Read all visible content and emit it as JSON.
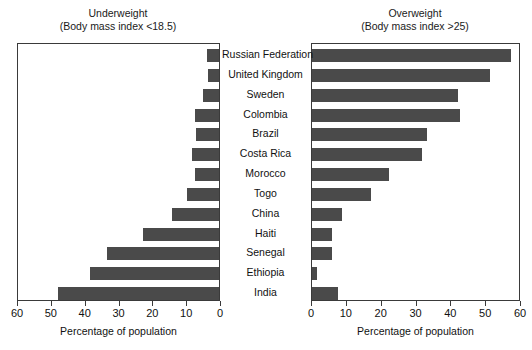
{
  "chart_data": {
    "type": "bar",
    "orientation": "horizontal",
    "layout": "paired-pyramid",
    "categories": [
      "Russian Federation",
      "United Kingdom",
      "Sweden",
      "Colombia",
      "Brazil",
      "Costa Rica",
      "Morocco",
      "Togo",
      "China",
      "Haiti",
      "Senegal",
      "Ethiopia",
      "India"
    ],
    "panels": [
      {
        "id": "underweight",
        "title_line1": "Underweight",
        "title_line2": "(Body mass index <18.5)",
        "xlabel": "Percentage of population",
        "xlim": [
          60,
          0
        ],
        "direction": "right-to-left",
        "ticks": [
          60,
          50,
          40,
          30,
          20,
          10,
          0
        ],
        "tick_labels": [
          "60",
          "50",
          "40",
          "30",
          "20",
          "10",
          "0"
        ],
        "values": [
          3.5,
          3.3,
          4.7,
          7.0,
          6.8,
          8.0,
          7.0,
          9.5,
          14.0,
          22.5,
          33.0,
          38.0,
          47.5
        ]
      },
      {
        "id": "overweight",
        "title_line1": "Overweight",
        "title_line2": "(Body mass index >25)",
        "xlabel": "Percentage of population",
        "xlim": [
          0,
          60
        ],
        "direction": "left-to-right",
        "ticks": [
          0,
          10,
          20,
          30,
          40,
          50,
          60
        ],
        "tick_labels": [
          "0",
          "10",
          "20",
          "30",
          "40",
          "50",
          "60"
        ],
        "values": [
          57.0,
          51.0,
          42.0,
          42.5,
          33.0,
          31.5,
          22.0,
          17.0,
          8.5,
          5.8,
          5.8,
          1.5,
          7.5
        ]
      }
    ],
    "grid": false,
    "legend": null,
    "bar_color": "#4a4a4a",
    "frame_color": "#3a3a3a",
    "background": "#ffffff"
  }
}
